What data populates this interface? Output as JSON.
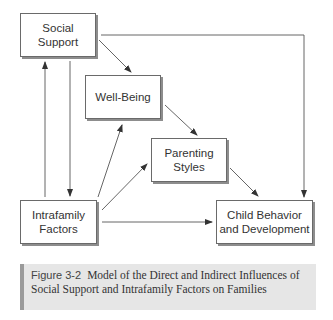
{
  "diagram": {
    "nodes": [
      {
        "id": "social-support",
        "label_line1": "Social",
        "label_line2": "Support"
      },
      {
        "id": "well-being",
        "label_line1": "Well-Being",
        "label_line2": ""
      },
      {
        "id": "parenting-styles",
        "label_line1": "Parenting",
        "label_line2": "Styles"
      },
      {
        "id": "intrafamily-factors",
        "label_line1": "Intrafamily",
        "label_line2": "Factors"
      },
      {
        "id": "child-behavior",
        "label_line1": "Child Behavior",
        "label_line2": "and Development"
      }
    ],
    "edges": [
      {
        "from": "social-support",
        "to": "well-being"
      },
      {
        "from": "social-support",
        "to": "child-behavior"
      },
      {
        "from": "social-support",
        "to": "intrafamily-factors"
      },
      {
        "from": "intrafamily-factors",
        "to": "social-support"
      },
      {
        "from": "intrafamily-factors",
        "to": "well-being"
      },
      {
        "from": "intrafamily-factors",
        "to": "parenting-styles"
      },
      {
        "from": "intrafamily-factors",
        "to": "child-behavior"
      },
      {
        "from": "well-being",
        "to": "parenting-styles"
      },
      {
        "from": "parenting-styles",
        "to": "child-behavior"
      }
    ]
  },
  "caption": {
    "figure_label": "Figure 3-2",
    "text": "Model of the Direct and Indirect Influences of Social Support and Intrafamily Factors on Families"
  }
}
